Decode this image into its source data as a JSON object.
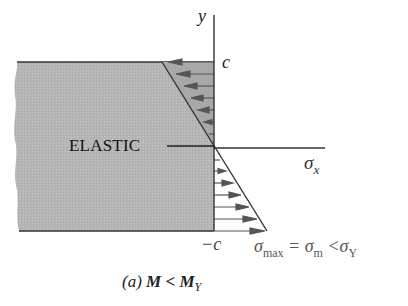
{
  "diagram": {
    "section_label": "ELASTIC",
    "axis_y_label": "y",
    "axis_x_label_base": "σ",
    "axis_x_label_sub": "x",
    "top_label": "c",
    "bottom_label": "−c",
    "stress_relation": {
      "part1": "σ",
      "part1_sub": "max",
      "part2": " = σ",
      "part2_sub": "m",
      "part3": " <σ",
      "part3_sub": "Y"
    },
    "caption": {
      "prefix": "(a) ",
      "text": "M < M",
      "sub": "Y"
    },
    "colors": {
      "beam_fill": "#b4b4b4",
      "line": "#333333",
      "arrow": "#555555"
    },
    "arrows_top_count": 6,
    "arrows_bottom_count": 7
  }
}
